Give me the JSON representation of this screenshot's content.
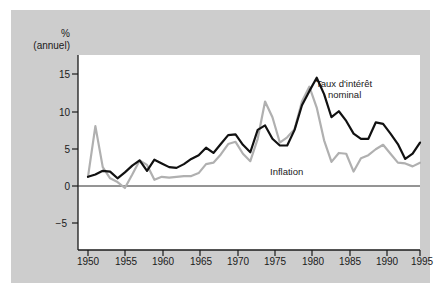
{
  "figure": {
    "background_color": "#cdcdcd",
    "plot_background_color": "#ffffff",
    "axis_color": "#1a1a1a"
  },
  "axis": {
    "y_title_line1": "%",
    "y_title_line2": "(annuel)",
    "y_ticks": [
      "15",
      "10",
      "5",
      "0",
      "−5"
    ],
    "x_ticks": [
      "1950",
      "1955",
      "1960",
      "1965",
      "1970",
      "1975",
      "1980",
      "1985",
      "1990",
      "1995"
    ]
  },
  "annotations": {
    "nominal_line1": "Taux d'intérêt",
    "nominal_line2": "nominal",
    "inflation": "Inflation"
  },
  "chart_data": {
    "type": "line",
    "title": "",
    "xlabel": "",
    "ylabel": "% (annuel)",
    "xlim": [
      1950,
      1995
    ],
    "ylim": [
      -5,
      17
    ],
    "grid": false,
    "legend": "inline-annotations",
    "y_tick_values": [
      15,
      10,
      5,
      0,
      -5
    ],
    "x_tick_values": [
      1950,
      1955,
      1960,
      1965,
      1970,
      1975,
      1980,
      1985,
      1990,
      1995
    ],
    "x": [
      1950,
      1951,
      1952,
      1953,
      1954,
      1955,
      1956,
      1957,
      1958,
      1959,
      1960,
      1961,
      1962,
      1963,
      1964,
      1965,
      1966,
      1967,
      1968,
      1969,
      1970,
      1971,
      1972,
      1973,
      1974,
      1975,
      1976,
      1977,
      1978,
      1979,
      1980,
      1981,
      1982,
      1983,
      1984,
      1985,
      1986,
      1987,
      1988,
      1989,
      1990,
      1991,
      1992,
      1993,
      1994,
      1995
    ],
    "series": [
      {
        "name": "Taux d'intérêt nominal",
        "color": "#111111",
        "line_width": 2.2,
        "values": [
          1.2,
          1.5,
          2.0,
          1.9,
          1.0,
          1.8,
          2.7,
          3.4,
          2.0,
          3.5,
          3.0,
          2.5,
          2.4,
          2.9,
          3.6,
          4.1,
          5.1,
          4.4,
          5.6,
          6.8,
          6.9,
          5.5,
          4.5,
          7.5,
          8.1,
          6.3,
          5.4,
          5.4,
          7.5,
          10.8,
          12.7,
          14.5,
          12.3,
          9.2,
          10.0,
          8.7,
          7.0,
          6.3,
          6.3,
          8.5,
          8.3,
          7.0,
          5.6,
          3.6,
          4.3,
          5.8
        ]
      },
      {
        "name": "Inflation",
        "color": "#b0b0b0",
        "line_width": 2.2,
        "values": [
          1.2,
          8.0,
          2.5,
          1.0,
          0.5,
          -0.3,
          1.5,
          3.4,
          2.8,
          0.8,
          1.2,
          1.1,
          1.2,
          1.3,
          1.3,
          1.7,
          2.9,
          3.1,
          4.2,
          5.6,
          5.9,
          4.3,
          3.3,
          6.3,
          11.3,
          9.2,
          5.8,
          6.5,
          7.6,
          11.3,
          13.3,
          10.5,
          6.1,
          3.2,
          4.4,
          4.3,
          1.9,
          3.7,
          4.1,
          4.9,
          5.5,
          4.3,
          3.1,
          3.0,
          2.6,
          3.1
        ]
      }
    ]
  }
}
